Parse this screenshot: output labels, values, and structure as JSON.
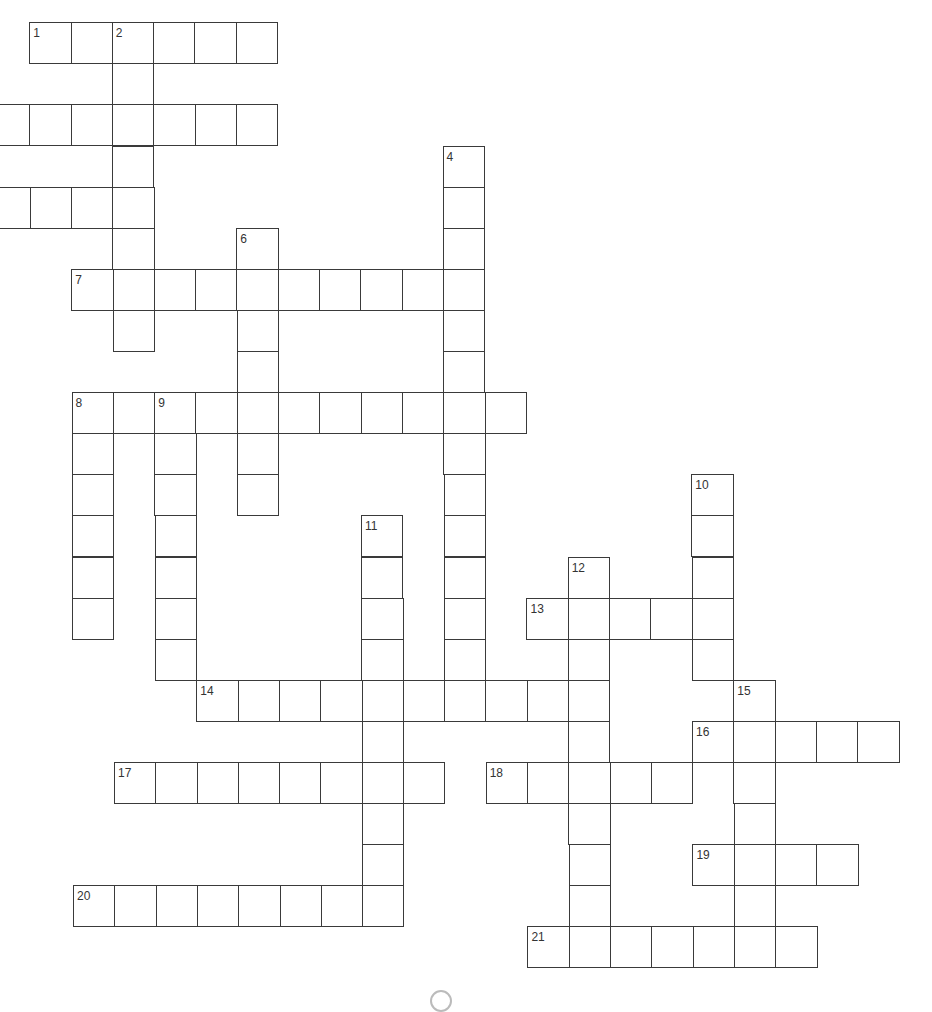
{
  "puzzle": {
    "type": "crossword",
    "cell_size": 41.3,
    "row_step": 41.1,
    "origin_x": 30,
    "origin_y": 23,
    "line_color": "#3a3a3a",
    "background": "#ffffff",
    "words": [
      {
        "number": "1",
        "dir": "across",
        "col": 0,
        "row": 0,
        "length": 6
      },
      {
        "number": "2",
        "dir": "down",
        "col": 2,
        "row": 0,
        "length": 8
      },
      {
        "number": "",
        "dir": "across",
        "col": -1,
        "row": 2,
        "length": 7
      },
      {
        "number": "",
        "dir": "across",
        "col": -1,
        "row": 4,
        "length": 4
      },
      {
        "number": "4",
        "dir": "down",
        "col": 10,
        "row": 3,
        "length": 14
      },
      {
        "number": "6",
        "dir": "down",
        "col": 5,
        "row": 5,
        "length": 7
      },
      {
        "number": "7",
        "dir": "across",
        "col": 1,
        "row": 6,
        "length": 10
      },
      {
        "number": "8",
        "dir": "across",
        "col": 1,
        "row": 9,
        "length": 11
      },
      {
        "number": "8",
        "dir": "down",
        "col": 1,
        "row": 9,
        "length": 6
      },
      {
        "number": "9",
        "dir": "down",
        "col": 3,
        "row": 9,
        "length": 7
      },
      {
        "number": "10",
        "dir": "down",
        "col": 16,
        "row": 11,
        "length": 5
      },
      {
        "number": "11",
        "dir": "down",
        "col": 8,
        "row": 12,
        "length": 10
      },
      {
        "number": "12",
        "dir": "down",
        "col": 13,
        "row": 13,
        "length": 10
      },
      {
        "number": "13",
        "dir": "across",
        "col": 12,
        "row": 14,
        "length": 5
      },
      {
        "number": "14",
        "dir": "across",
        "col": 4,
        "row": 16,
        "length": 10
      },
      {
        "number": "15",
        "dir": "down",
        "col": 17,
        "row": 16,
        "length": 7
      },
      {
        "number": "16",
        "dir": "across",
        "col": 16,
        "row": 17,
        "length": 5
      },
      {
        "number": "17",
        "dir": "across",
        "col": 2,
        "row": 18,
        "length": 8
      },
      {
        "number": "18",
        "dir": "across",
        "col": 11,
        "row": 18,
        "length": 5
      },
      {
        "number": "19",
        "dir": "across",
        "col": 16,
        "row": 20,
        "length": 4
      },
      {
        "number": "20",
        "dir": "across",
        "col": 1,
        "row": 21,
        "length": 8
      },
      {
        "number": "21",
        "dir": "across",
        "col": 12,
        "row": 22,
        "length": 7
      }
    ],
    "clue_numbers": [
      "1",
      "2",
      "4",
      "6",
      "7",
      "8",
      "9",
      "10",
      "11",
      "12",
      "13",
      "14",
      "15",
      "16",
      "17",
      "18",
      "19",
      "20",
      "21"
    ]
  }
}
